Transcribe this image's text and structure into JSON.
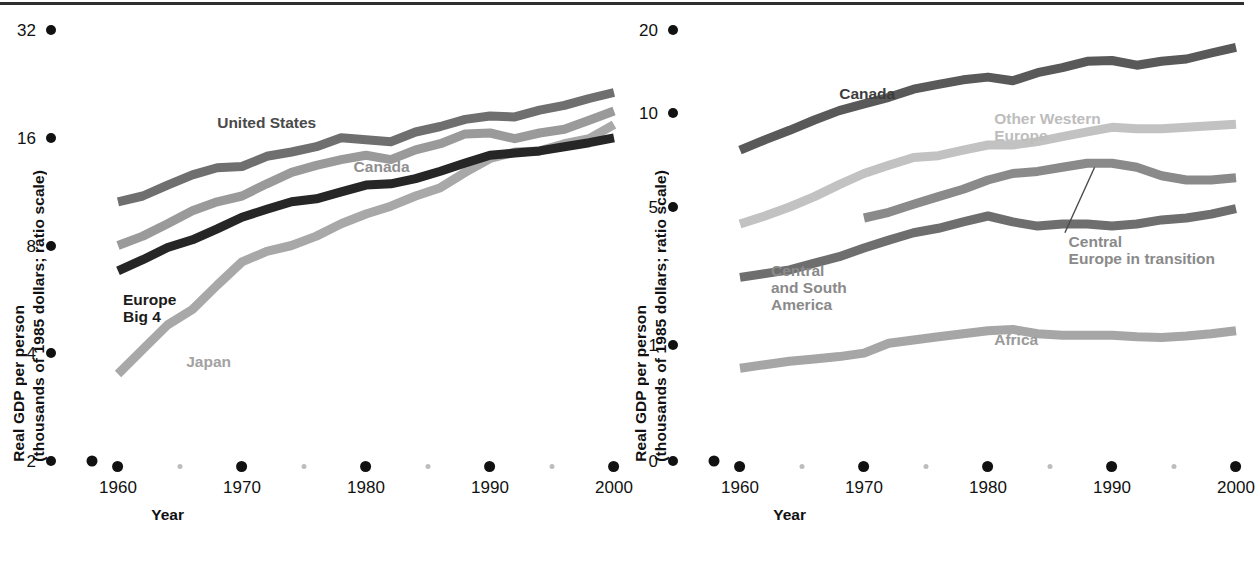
{
  "figure": {
    "background": "#ffffff",
    "rule_color": "#2e2e2e"
  },
  "axis_common": {
    "y_title_line1": "Real GDP per person",
    "y_title_line2": "(thousands of 1985 dollars; ratio scale)",
    "x_title": "Year",
    "x_major_labels": [
      "1960",
      "1970",
      "1980",
      "1990",
      "2000"
    ],
    "x_major_values": [
      1960,
      1970,
      1980,
      1990,
      2000
    ],
    "x_minor_values": [
      1965,
      1975,
      1985,
      1995
    ],
    "xlim": [
      1956,
      2001
    ]
  },
  "chart_data": [
    {
      "id": "left",
      "type": "line",
      "title": "",
      "xlabel": "Year",
      "ylabel": "Real GDP per person (thousands of 1985 dollars; ratio scale)",
      "scale": "log2",
      "ylim": [
        2,
        32
      ],
      "yticks": [
        2,
        4,
        8,
        16,
        32
      ],
      "ytick_labels": [
        "2",
        "4",
        "8",
        "16",
        "32"
      ],
      "grid": false,
      "legend": "inline-annotations",
      "x": [
        1960,
        1962,
        1964,
        1966,
        1968,
        1970,
        1972,
        1974,
        1976,
        1978,
        1980,
        1982,
        1984,
        1986,
        1988,
        1990,
        1992,
        1994,
        1996,
        1998,
        2000
      ],
      "series": [
        {
          "name": "United States",
          "color": "#6f6f6f",
          "label": "United States",
          "label_color": "#4a4a4a",
          "values": [
            10.6,
            11.0,
            11.8,
            12.6,
            13.2,
            13.3,
            14.2,
            14.6,
            15.1,
            16.0,
            15.8,
            15.6,
            16.6,
            17.2,
            18.0,
            18.4,
            18.3,
            19.1,
            19.7,
            20.6,
            21.4
          ]
        },
        {
          "name": "Canada",
          "color": "#9a9a9a",
          "label": "Canada",
          "label_color": "#8f8f8f",
          "values": [
            8.0,
            8.5,
            9.2,
            10.0,
            10.6,
            11.0,
            11.9,
            12.8,
            13.4,
            13.9,
            14.3,
            13.9,
            14.8,
            15.4,
            16.4,
            16.5,
            15.9,
            16.5,
            16.9,
            17.9,
            19.0
          ]
        },
        {
          "name": "Japan",
          "color": "#a8a8a8",
          "label": "Japan",
          "label_color": "#a2a2a2",
          "values": [
            3.5,
            4.1,
            4.8,
            5.3,
            6.2,
            7.2,
            7.7,
            8.0,
            8.5,
            9.2,
            9.8,
            10.3,
            11.0,
            11.6,
            12.8,
            14.0,
            14.6,
            14.7,
            15.4,
            15.9,
            17.4
          ]
        },
        {
          "name": "Europe Big 4",
          "color": "#262626",
          "label": "Europe\nBig 4",
          "label_color": "#1b1b1b",
          "values": [
            6.8,
            7.3,
            7.9,
            8.3,
            8.9,
            9.6,
            10.1,
            10.6,
            10.8,
            11.3,
            11.8,
            11.9,
            12.3,
            12.9,
            13.6,
            14.3,
            14.5,
            14.7,
            15.1,
            15.5,
            16.0
          ]
        }
      ],
      "annotations": [
        {
          "text": "United States",
          "x": 1968,
          "y": 17.5
        },
        {
          "text": "Canada",
          "x": 1979,
          "y": 13.2
        },
        {
          "text": "Europe\nBig 4",
          "x": 1960.4,
          "y": 5.6
        },
        {
          "text": "Japan",
          "x": 1965.5,
          "y": 3.75
        }
      ]
    },
    {
      "id": "right",
      "type": "line",
      "title": "",
      "xlabel": "Year",
      "ylabel": "Real GDP per person (thousands of 1985 dollars; ratio scale)",
      "scale": "log-with-zero-break",
      "ylim": [
        0,
        20
      ],
      "yticks": [
        0,
        1,
        5,
        10,
        20
      ],
      "ytick_labels": [
        "0",
        "1",
        "5",
        "10",
        "20"
      ],
      "grid": false,
      "legend": "inline-annotations",
      "x": [
        1960,
        1962,
        1964,
        1966,
        1968,
        1970,
        1972,
        1974,
        1976,
        1978,
        1980,
        1982,
        1984,
        1986,
        1988,
        1990,
        1992,
        1994,
        1996,
        1998,
        2000
      ],
      "series": [
        {
          "name": "Canada",
          "color": "#595959",
          "label": "Canada",
          "label_color": "#3d3d3d",
          "values": [
            7.6,
            8.2,
            8.8,
            9.5,
            10.2,
            10.8,
            11.4,
            12.2,
            12.7,
            13.2,
            13.5,
            13.1,
            14.0,
            14.6,
            15.4,
            15.5,
            14.9,
            15.4,
            15.7,
            16.5,
            17.3
          ]
        },
        {
          "name": "Other Western Europe",
          "color": "#c2c2c2",
          "label": "Other Western\nEurope",
          "label_color": "#bdbdbd",
          "values": [
            4.1,
            4.5,
            5.0,
            5.4,
            5.9,
            6.4,
            6.8,
            7.2,
            7.3,
            7.6,
            7.9,
            7.9,
            8.1,
            8.4,
            8.7,
            9.0,
            8.9,
            8.9,
            9.0,
            9.1,
            9.2
          ],
          "start_year": 1960
        },
        {
          "name": "Central Europe in transition",
          "color": "#8a8a8a",
          "label": "Central\nEurope in transition",
          "label_color": "#8a8a8a",
          "values": [
            4.4,
            4.7,
            5.1,
            5.4,
            5.7,
            6.1,
            6.4,
            6.5,
            6.7,
            6.9,
            6.9,
            6.7,
            6.3,
            6.1,
            6.1,
            6.2
          ],
          "start_year": 1970,
          "leader_line": true
        },
        {
          "name": "Central and South America",
          "color": "#6e6e6e",
          "label": "Central\nand South\nAmerica",
          "label_color": "#8a8a8a",
          "values": [
            2.2,
            2.3,
            2.4,
            2.6,
            2.8,
            3.1,
            3.4,
            3.7,
            3.9,
            4.2,
            4.5,
            4.2,
            4.0,
            4.1,
            4.1,
            4.0,
            4.1,
            4.3,
            4.4,
            4.6,
            4.9
          ]
        },
        {
          "name": "Africa",
          "color": "#a6a6a6",
          "label": "Africa",
          "label_color": "#9a9a9a",
          "values": [
            0.8,
            0.83,
            0.86,
            0.88,
            0.9,
            0.93,
            1.02,
            1.06,
            1.1,
            1.14,
            1.18,
            1.2,
            1.14,
            1.12,
            1.12,
            1.12,
            1.1,
            1.09,
            1.11,
            1.14,
            1.18
          ]
        }
      ],
      "annotations": [
        {
          "text": "Canada",
          "x": 1968,
          "y": 11.6
        },
        {
          "text": "Other Western\nEurope",
          "x": 1980.5,
          "y": 9.5
        },
        {
          "text": "Central\nEurope in transition",
          "x": 1986.5,
          "y": 3.3
        },
        {
          "text": "Central\nand South\nAmerica",
          "x": 1962.5,
          "y": 2.35
        },
        {
          "text": "Africa",
          "x": 1980.5,
          "y": 1.05
        }
      ]
    }
  ]
}
